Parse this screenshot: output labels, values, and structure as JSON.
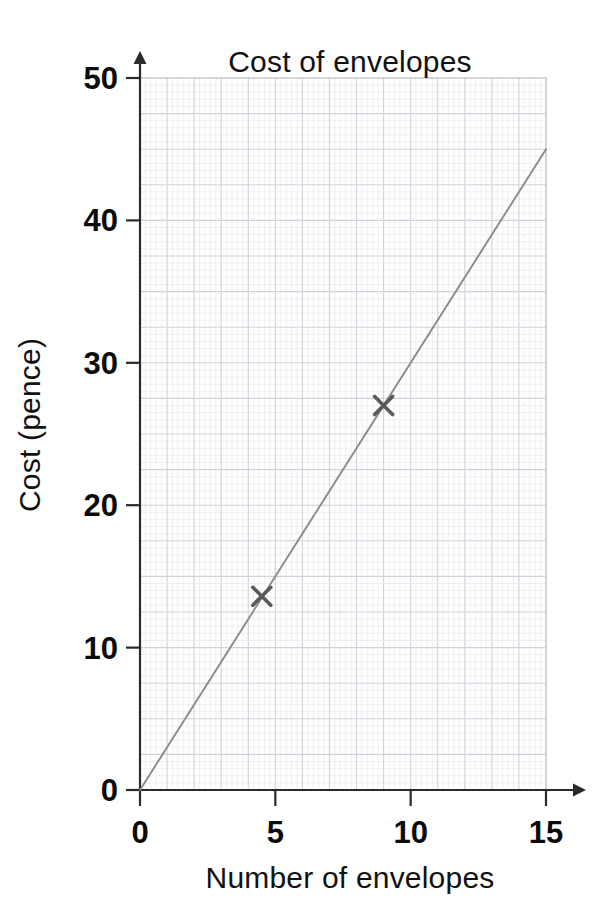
{
  "chart_data": {
    "type": "line",
    "title": "Cost of envelopes",
    "xlabel": "Number of envelopes",
    "ylabel": "Cost (pence)",
    "xlim": [
      0,
      15
    ],
    "ylim": [
      0,
      50
    ],
    "xticks": [
      "0",
      "5",
      "10",
      "15"
    ],
    "xtick_values": [
      0,
      5,
      10,
      15
    ],
    "yticks": [
      "0",
      "10",
      "20",
      "30",
      "40",
      "50"
    ],
    "ytick_values": [
      0,
      10,
      20,
      30,
      40,
      50
    ],
    "grid": "graph-paper minor and major gridlines",
    "legend": "none",
    "series": [
      {
        "name": "line of best fit",
        "type": "line",
        "x": [
          0,
          15
        ],
        "y": [
          0,
          45
        ],
        "color": "#8a8a8a",
        "note": "straight line through origin, slope 3 pence per envelope"
      },
      {
        "name": "plotted points",
        "type": "scatter",
        "marker": "x-cross",
        "color": "#5a5a5a",
        "points": [
          {
            "x": 4.5,
            "y": 13.6
          },
          {
            "x": 9.0,
            "y": 27.0
          }
        ]
      }
    ]
  },
  "axes": {
    "x_tick_labels": [
      "0",
      "5",
      "10",
      "15"
    ],
    "y_tick_labels": [
      "0",
      "10",
      "20",
      "30",
      "40",
      "50"
    ],
    "x_axis_title": "Number of envelopes",
    "y_axis_title": "Cost (pence)"
  },
  "title": {
    "text": "Cost of envelopes"
  },
  "colors": {
    "background": "#ffffff",
    "axis": "#2a2a2a",
    "text": "#0b0b0b",
    "fit_line": "#8a8a8a",
    "marker": "#5a5a5a",
    "grid_minor": "#e9e9ee",
    "grid_major": "#d2d2dc"
  }
}
